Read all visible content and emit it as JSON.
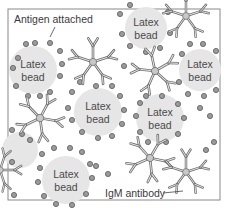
{
  "diagram": {
    "labels": {
      "antigen": "Antigen attached",
      "antibody": "IgM antibody"
    },
    "bead_label_line1": "Latex",
    "bead_label_line2": "bead",
    "bead_count": 7,
    "igm_count": 7,
    "colors": {
      "frame": "#8a8a8a",
      "bead_fill": "#e6e6e6",
      "antigen_fill": "#9a9a9a",
      "antigen_stroke": "#5a5a5a",
      "antibody_stroke": "#6e6e6e",
      "antibody_fill": "#e8e8e8",
      "text": "#3a3a3a"
    }
  }
}
